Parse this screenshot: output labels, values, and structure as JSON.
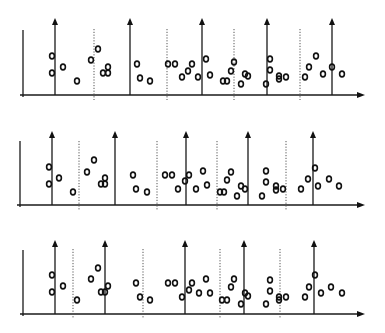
{
  "diagram": {
    "type": "event-timelines",
    "colors": {
      "line": "#1a1a1a",
      "dotted": "#555555",
      "marker": "#111111",
      "background": "#ffffff"
    },
    "marker_glyph": "o",
    "panels": [
      {
        "name": "timeline-1",
        "baseline_y": 95,
        "axis_left_x": 23,
        "axis_top_y": 30,
        "x_start": 20,
        "x_end": 365,
        "arrow_top_y": 18,
        "arrows_x": [
          55,
          130,
          202,
          267,
          332
        ],
        "dotted_x": [
          94,
          167,
          234,
          300
        ],
        "dotted_top_y": 29,
        "points": [
          [
            52,
            56
          ],
          [
            52,
            73
          ],
          [
            63,
            67
          ],
          [
            77,
            81
          ],
          [
            91,
            60
          ],
          [
            98,
            49
          ],
          [
            103,
            73
          ],
          [
            108,
            73
          ],
          [
            108,
            67
          ],
          [
            137,
            64
          ],
          [
            140,
            78
          ],
          [
            150,
            81
          ],
          [
            168,
            64
          ],
          [
            175,
            64
          ],
          [
            182,
            77
          ],
          [
            188,
            71
          ],
          [
            192,
            64
          ],
          [
            198,
            77
          ],
          [
            206,
            59
          ],
          [
            210,
            75
          ],
          [
            223,
            81
          ],
          [
            227,
            81
          ],
          [
            231,
            71
          ],
          [
            234,
            62
          ],
          [
            241,
            84
          ],
          [
            245,
            74
          ],
          [
            248,
            76
          ],
          [
            266,
            84
          ],
          [
            270,
            59
          ],
          [
            270,
            70
          ],
          [
            279,
            79
          ],
          [
            279,
            76
          ],
          [
            286,
            77
          ],
          [
            305,
            77
          ],
          [
            309,
            67
          ],
          [
            316,
            56
          ],
          [
            323,
            74
          ],
          [
            332,
            67
          ],
          [
            342,
            74
          ]
        ]
      },
      {
        "name": "timeline-2",
        "baseline_y": 205,
        "axis_left_x": 20,
        "axis_top_y": 141,
        "x_start": 17,
        "x_end": 365,
        "arrow_top_y": 131,
        "arrows_x": [
          52,
          115,
          186,
          248,
          313
        ],
        "dotted_x": [
          79,
          157,
          217,
          286
        ],
        "dotted_top_y": 141,
        "points": [
          [
            49,
            167
          ],
          [
            49,
            184
          ],
          [
            59,
            178
          ],
          [
            73,
            192
          ],
          [
            87,
            172
          ],
          [
            94,
            160
          ],
          [
            101,
            184
          ],
          [
            105,
            184
          ],
          [
            105,
            178
          ],
          [
            133,
            175
          ],
          [
            136,
            189
          ],
          [
            147,
            192
          ],
          [
            165,
            175
          ],
          [
            172,
            175
          ],
          [
            178,
            189
          ],
          [
            185,
            181
          ],
          [
            189,
            175
          ],
          [
            196,
            189
          ],
          [
            203,
            171
          ],
          [
            207,
            185
          ],
          [
            220,
            192
          ],
          [
            224,
            192
          ],
          [
            227,
            180
          ],
          [
            231,
            172
          ],
          [
            237,
            196
          ],
          [
            241,
            186
          ],
          [
            245,
            189
          ],
          [
            262,
            196
          ],
          [
            266,
            171
          ],
          [
            266,
            182
          ],
          [
            276,
            190
          ],
          [
            276,
            186
          ],
          [
            283,
            189
          ],
          [
            301,
            189
          ],
          [
            308,
            179
          ],
          [
            315,
            168
          ],
          [
            318,
            186
          ],
          [
            329,
            179
          ],
          [
            339,
            186
          ]
        ]
      },
      {
        "name": "timeline-3",
        "baseline_y": 314,
        "axis_left_x": 23,
        "axis_top_y": 250,
        "x_start": 20,
        "x_end": 365,
        "arrow_top_y": 240,
        "arrows_x": [
          55,
          105,
          185,
          244,
          314
        ],
        "dotted_x": [
          73,
          143,
          220,
          280
        ],
        "dotted_top_y": 249,
        "points": [
          [
            52,
            275
          ],
          [
            52,
            292
          ],
          [
            63,
            286
          ],
          [
            77,
            300
          ],
          [
            91,
            279
          ],
          [
            98,
            268
          ],
          [
            101,
            292
          ],
          [
            105,
            292
          ],
          [
            108,
            286
          ],
          [
            136,
            283
          ],
          [
            140,
            297
          ],
          [
            150,
            300
          ],
          [
            168,
            283
          ],
          [
            175,
            283
          ],
          [
            182,
            297
          ],
          [
            189,
            290
          ],
          [
            192,
            283
          ],
          [
            199,
            293
          ],
          [
            206,
            279
          ],
          [
            210,
            293
          ],
          [
            222,
            300
          ],
          [
            227,
            300
          ],
          [
            231,
            287
          ],
          [
            234,
            279
          ],
          [
            241,
            304
          ],
          [
            245,
            293
          ],
          [
            248,
            296
          ],
          [
            266,
            304
          ],
          [
            270,
            280
          ],
          [
            270,
            291
          ],
          [
            279,
            300
          ],
          [
            279,
            297
          ],
          [
            286,
            297
          ],
          [
            305,
            297
          ],
          [
            309,
            287
          ],
          [
            315,
            275
          ],
          [
            321,
            293
          ],
          [
            331,
            287
          ],
          [
            342,
            293
          ]
        ]
      }
    ]
  }
}
